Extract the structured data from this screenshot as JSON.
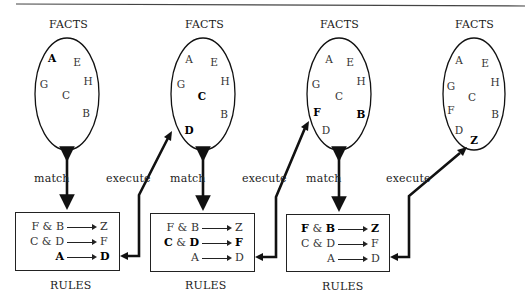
{
  "diagram": {
    "stages": [
      {
        "facts_title": "FACTS",
        "facts": [
          {
            "label": "A",
            "x": 52,
            "y": 58,
            "bold": true
          },
          {
            "label": "E",
            "x": 77,
            "y": 62,
            "bold": false
          },
          {
            "label": "H",
            "x": 88,
            "y": 81,
            "bold": false
          },
          {
            "label": "G",
            "x": 44,
            "y": 84,
            "bold": false
          },
          {
            "label": "C",
            "x": 66,
            "y": 95,
            "bold": false
          },
          {
            "label": "B",
            "x": 86,
            "y": 113,
            "bold": false
          }
        ],
        "link_label": "match",
        "rules_title": "RULES",
        "rules": [
          {
            "lhs": [
              {
                "t": "F",
                "b": false
              },
              {
                "t": " & ",
                "b": false
              },
              {
                "t": "B",
                "b": false
              }
            ],
            "rhs": {
              "t": "Z",
              "b": false
            }
          },
          {
            "lhs": [
              {
                "t": "C",
                "b": false
              },
              {
                "t": " & ",
                "b": false
              },
              {
                "t": "D",
                "b": false
              }
            ],
            "rhs": {
              "t": "F",
              "b": false
            }
          },
          {
            "lhs": [
              {
                "t": "A",
                "b": true
              }
            ],
            "rhs": {
              "t": "D",
              "b": true
            }
          }
        ],
        "execute_label": "execute"
      },
      {
        "facts_title": "FACTS",
        "facts": [
          {
            "label": "A",
            "x": 189,
            "y": 59,
            "bold": false
          },
          {
            "label": "E",
            "x": 214,
            "y": 62,
            "bold": false
          },
          {
            "label": "H",
            "x": 225,
            "y": 81,
            "bold": false
          },
          {
            "label": "G",
            "x": 181,
            "y": 84,
            "bold": false
          },
          {
            "label": "C",
            "x": 202,
            "y": 96,
            "bold": true
          },
          {
            "label": "B",
            "x": 224,
            "y": 114,
            "bold": false
          },
          {
            "label": "D",
            "x": 189,
            "y": 130,
            "bold": true
          }
        ],
        "link_label": "match",
        "rules_title": "RULES",
        "rules": [
          {
            "lhs": [
              {
                "t": "F",
                "b": false
              },
              {
                "t": " & ",
                "b": false
              },
              {
                "t": "B",
                "b": false
              }
            ],
            "rhs": {
              "t": "Z",
              "b": false
            }
          },
          {
            "lhs": [
              {
                "t": "C",
                "b": true
              },
              {
                "t": " & ",
                "b": false
              },
              {
                "t": "D",
                "b": true
              }
            ],
            "rhs": {
              "t": "F",
              "b": true
            }
          },
          {
            "lhs": [
              {
                "t": "A",
                "b": false
              }
            ],
            "rhs": {
              "t": "D",
              "b": false
            }
          }
        ],
        "execute_label": "execute"
      },
      {
        "facts_title": "FACTS",
        "facts": [
          {
            "label": "A",
            "x": 329,
            "y": 59,
            "bold": false
          },
          {
            "label": "E",
            "x": 350,
            "y": 62,
            "bold": false
          },
          {
            "label": "H",
            "x": 361,
            "y": 81,
            "bold": false
          },
          {
            "label": "G",
            "x": 316,
            "y": 84,
            "bold": false
          },
          {
            "label": "C",
            "x": 339,
            "y": 96,
            "bold": false
          },
          {
            "label": "F",
            "x": 317,
            "y": 112,
            "bold": true
          },
          {
            "label": "B",
            "x": 361,
            "y": 114,
            "bold": true
          },
          {
            "label": "D",
            "x": 326,
            "y": 130,
            "bold": false
          }
        ],
        "link_label": "match",
        "rules_title": "RULES",
        "rules": [
          {
            "lhs": [
              {
                "t": "F",
                "b": true
              },
              {
                "t": " & ",
                "b": false
              },
              {
                "t": "B",
                "b": true
              }
            ],
            "rhs": {
              "t": "Z",
              "b": true
            }
          },
          {
            "lhs": [
              {
                "t": "C",
                "b": false
              },
              {
                "t": " & ",
                "b": false
              },
              {
                "t": "D",
                "b": false
              }
            ],
            "rhs": {
              "t": "F",
              "b": false
            }
          },
          {
            "lhs": [
              {
                "t": "A",
                "b": false
              }
            ],
            "rhs": {
              "t": "D",
              "b": false
            }
          }
        ],
        "execute_label": "execute"
      },
      {
        "facts_title": "FACTS",
        "facts": [
          {
            "label": "A",
            "x": 459,
            "y": 60,
            "bold": false
          },
          {
            "label": "E",
            "x": 485,
            "y": 63,
            "bold": false
          },
          {
            "label": "H",
            "x": 495,
            "y": 82,
            "bold": false
          },
          {
            "label": "G",
            "x": 451,
            "y": 86,
            "bold": false
          },
          {
            "label": "C",
            "x": 472,
            "y": 97,
            "bold": false
          },
          {
            "label": "F",
            "x": 451,
            "y": 110,
            "bold": false
          },
          {
            "label": "B",
            "x": 495,
            "y": 114,
            "bold": false
          },
          {
            "label": "D",
            "x": 459,
            "y": 130,
            "bold": false
          },
          {
            "label": "Z",
            "x": 474,
            "y": 140,
            "bold": true
          }
        ]
      }
    ]
  }
}
